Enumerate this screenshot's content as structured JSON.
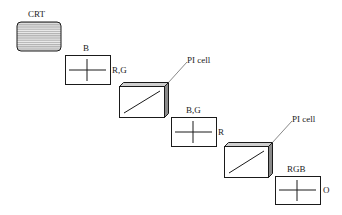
{
  "diagram": {
    "crt": {
      "label": "CRT"
    },
    "polarizer1": {
      "top_label": "B",
      "side_label": "R,G"
    },
    "pi_cell1": {
      "label": "PI cell"
    },
    "polarizer2": {
      "top_label": "B,G",
      "side_label": "R"
    },
    "pi_cell2": {
      "label": "PI cell"
    },
    "polarizer3": {
      "top_label": "RGB",
      "side_label": "O"
    }
  },
  "colors": {
    "line": "#1a1a1a",
    "crt_fill": "#b8b8b8",
    "crt_stripe": "#f0f0f0",
    "cell_side": "#8a8a8a",
    "cell_top": "#cfcfcf"
  }
}
